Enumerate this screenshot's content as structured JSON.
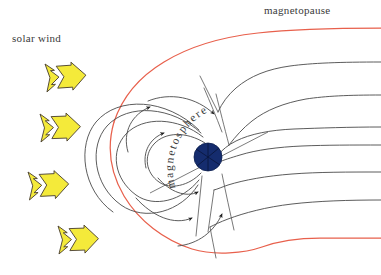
{
  "figure": {
    "title_text": "",
    "background_color": "#ffffff",
    "width": 381,
    "height": 275
  },
  "labels": {
    "solar_wind": "solar wind",
    "magnetopause": "magnetopause",
    "magnetosphere": "magnetosphere"
  },
  "colors": {
    "magnetopause_line": "#e8604c",
    "field_line": "#4a4a4a",
    "earth_body": "#152c6e",
    "earth_outline": "#0d1f4f",
    "solar_wind_arrow_fill": "#f4ea3a",
    "solar_wind_arrow_stroke": "#4a4030",
    "text": "#3a3a3a"
  },
  "elements": {
    "earth": {
      "name": "earth-sphere",
      "cx": 208,
      "cy": 157,
      "r": 14
    },
    "solar_wind_arrows": [
      {
        "id": "solar-wind-arrow-1",
        "x": 58,
        "y": 72,
        "scale": 1.0,
        "rotate": -4
      },
      {
        "id": "solar-wind-arrow-2",
        "x": 52,
        "y": 122,
        "scale": 1.0,
        "rotate": -2
      },
      {
        "id": "solar-wind-arrow-3",
        "x": 40,
        "y": 180,
        "scale": 1.0,
        "rotate": -3
      },
      {
        "id": "solar-wind-arrow-4",
        "x": 72,
        "y": 235,
        "scale": 1.0,
        "rotate": -2
      }
    ],
    "magnetopause_paths": {
      "upper": "M 381,28 C 330,28 292,29 258,33 C 222,37 190,46 164,62 C 139,77 122,98 114,122",
      "lower": "M 114,122 C 107,146 110,172 124,196 C 139,221 164,240 192,249 C 215,256 245,253 262,247 C 278,241 296,238 320,238 C 342,238 365,238 381,238"
    },
    "tail_field_lines": [
      "M 381,62 C 340,62 312,63 290,66 C 268,69 250,76 236,88 C 228,95 222,103 218,112",
      "M 381,95 C 348,95 326,96 306,99 C 284,103 266,110 252,121 C 243,128 236,136 229,145",
      "M 381,127 C 350,127 320,128 294,129 C 270,130 250,134 236,141 C 228,145 222,150 218,155",
      "M 381,145 C 352,145 326,145 302,146 C 278,147 256,150 240,155 C 230,158 224,160 219,162",
      "M 381,172 C 348,172 318,172 292,174 C 266,176 244,180 228,185 C 222,187 218,189 214,190",
      "M 381,200 C 348,200 318,201 292,204 C 266,207 244,213 228,219 C 220,222 214,225 210,227"
    ],
    "polar_cusp_lines": [
      "M 218,112 C 212,100 206,88 200,76",
      "M 229,145 C 224,126 220,110 216,94",
      "M 214,190 C 212,204 210,218 208,232",
      "M 210,227 C 212,238 214,248 216,256"
    ],
    "closed_field_lines": [
      "M 206,142 C 186,130 164,130 152,142 C 140,154 142,172 156,182 C 168,191 188,188 202,174",
      "M 204,136 C 178,116 142,114 124,132 C 108,149 112,178 134,194 C 152,207 182,201 200,180",
      "M 202,132 C 172,104 126,100 104,124 C 86,144 90,184 118,204 C 142,221 180,212 198,184"
    ],
    "cusp_arcs": [
      "M 150,99 C 170,92 196,96 212,112",
      "M 132,118 C 146,106 162,101 178,102",
      "M 172,214 C 192,224 214,222 230,206",
      "M 188,244 C 206,242 222,232 232,218"
    ],
    "magnetic_axis": {
      "x1": 152,
      "y1": 192,
      "x2": 266,
      "y2": 133
    },
    "earth_internal_lines": [
      {
        "x1": 196,
        "y1": 149,
        "x2": 220,
        "y2": 165
      },
      {
        "x1": 199,
        "y1": 166,
        "x2": 217,
        "y2": 148
      },
      {
        "x1": 208,
        "y1": 143,
        "x2": 208,
        "y2": 171
      }
    ]
  },
  "label_positions": {
    "solar_wind": {
      "x": 12,
      "y": 42
    },
    "magnetopause": {
      "x": 264,
      "y": 14
    },
    "magnetosphere_arc": "M 176,186 C 166,156 178,126 206,112 C 232,99 256,104 270,118"
  }
}
